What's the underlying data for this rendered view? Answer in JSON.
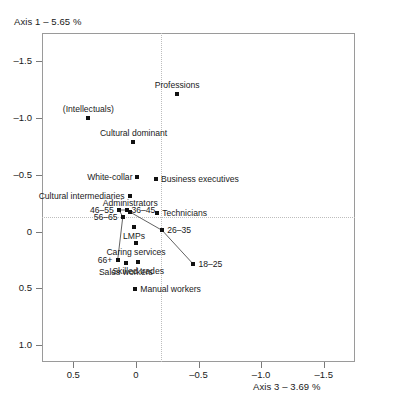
{
  "chart_data": {
    "type": "scatter",
    "title": "",
    "xlabel": "Axis 3 – 3.69 %",
    "ylabel": "Axis 1 – 5.65 %",
    "xlim": [
      0.75,
      -1.75
    ],
    "ylim": [
      -1.75,
      1.15
    ],
    "x_ticks": [
      "0.5",
      "0",
      "-0.5",
      "-1.0",
      "-1.5"
    ],
    "x_tick_values": [
      0.5,
      0,
      -0.5,
      -1.0,
      -1.5
    ],
    "y_ticks": [
      "-1.5",
      "-1.0",
      "-0.5",
      "0",
      "0.5",
      "1.0"
    ],
    "y_tick_values": [
      -1.5,
      -1.0,
      -0.5,
      0,
      0.5,
      1.0
    ],
    "grid": false,
    "reference_lines": {
      "vertical_x": 0,
      "horizontal_y": 0,
      "style": "dotted"
    },
    "legend": "none",
    "axes_reversed": {
      "x": true,
      "y": true
    },
    "points": [
      {
        "label": "(Intellectuals)",
        "x": 0.38,
        "y": -1.0,
        "label_pos": "above"
      },
      {
        "label": "Professions",
        "x": -0.33,
        "y": -1.21,
        "label_pos": "above"
      },
      {
        "label": "Cultural dominant",
        "x": 0.02,
        "y": -0.79,
        "label_pos": "above"
      },
      {
        "label": "White-collar",
        "x": -0.01,
        "y": -0.48,
        "label_pos": "left"
      },
      {
        "label": "Business executives",
        "x": -0.16,
        "y": -0.46,
        "label_pos": "right"
      },
      {
        "label": "Cultural intermediaries",
        "x": 0.05,
        "y": -0.31,
        "label_pos": "left"
      },
      {
        "label": "Administrators",
        "x": 0.045,
        "y": -0.17,
        "label_pos": "above"
      },
      {
        "label": "Technicians",
        "x": -0.17,
        "y": -0.16,
        "label_pos": "right"
      },
      {
        "label": "LMPs",
        "x": 0.015,
        "y": -0.04,
        "label_pos": "below"
      },
      {
        "label": "Caring services",
        "x": 0.0,
        "y": 0.1,
        "label_pos": "below"
      },
      {
        "label": "Sales workers",
        "x": 0.08,
        "y": 0.28,
        "label_pos": "below"
      },
      {
        "label": "Skilled trades",
        "x": -0.02,
        "y": 0.27,
        "label_pos": "below"
      },
      {
        "label": "Manual workers",
        "x": 0.005,
        "y": 0.51,
        "label_pos": "right"
      }
    ],
    "age_series": {
      "name": "Age groups",
      "connected": true,
      "points": [
        {
          "label": "46–55",
          "x": 0.135,
          "y": -0.19,
          "label_pos": "left"
        },
        {
          "label": "36–45",
          "x": 0.075,
          "y": -0.19,
          "label_pos": "right"
        },
        {
          "label": "56–65",
          "x": 0.105,
          "y": -0.13,
          "label_pos": "left"
        },
        {
          "label": "26–35",
          "x": -0.21,
          "y": -0.01,
          "label_pos": "right"
        },
        {
          "label": "66+",
          "x": 0.145,
          "y": 0.25,
          "label_pos": "left"
        },
        {
          "label": "18–25",
          "x": -0.46,
          "y": 0.29,
          "label_pos": "right"
        }
      ],
      "path_order": [
        "66+",
        "56–65",
        "46–55",
        "36–45",
        "26–35",
        "18–25"
      ]
    }
  }
}
